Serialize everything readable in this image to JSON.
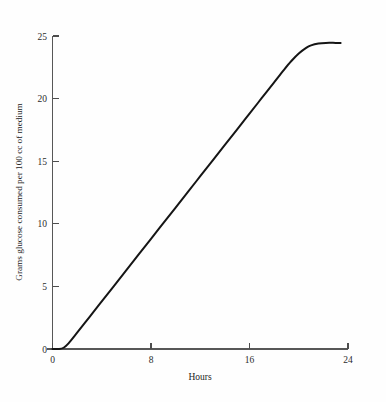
{
  "chart_data": {
    "type": "line",
    "title": "",
    "xlabel": "Hours",
    "ylabel": "Grams glucose consumed per 100 cc of medium",
    "xlim": [
      0,
      24
    ],
    "ylim": [
      0,
      25
    ],
    "xticks": [
      0,
      8,
      16,
      24
    ],
    "xticklabels": [
      "0",
      "8",
      "16",
      "24"
    ],
    "yticks": [
      0,
      5,
      10,
      15,
      20,
      25
    ],
    "yticklabels": [
      "0",
      "5",
      "10",
      "15",
      "20",
      "25"
    ],
    "grid": false,
    "legend": "none",
    "series": [
      {
        "name": "glucose consumed",
        "x": [
          0.0,
          0.5,
          0.9,
          1.3,
          2.0,
          3.0,
          4.0,
          5.0,
          6.0,
          7.0,
          8.0,
          9.0,
          10.0,
          11.0,
          12.0,
          13.0,
          14.0,
          15.0,
          16.0,
          17.0,
          18.0,
          18.8,
          19.4,
          20.0,
          20.6,
          21.0,
          21.6,
          22.2,
          23.0,
          23.4
        ],
        "y": [
          0.0,
          0.0,
          0.1,
          0.45,
          1.3,
          2.55,
          3.8,
          5.05,
          6.3,
          7.55,
          8.8,
          10.05,
          11.3,
          12.55,
          13.8,
          15.05,
          16.3,
          17.55,
          18.8,
          20.05,
          21.3,
          22.3,
          23.0,
          23.6,
          24.05,
          24.25,
          24.4,
          24.45,
          24.45,
          24.45
        ]
      }
    ],
    "annotations": {
      "plateau_value": 24.45,
      "lag_end_hours": 0.9,
      "linear_slope_grams_per_hour": 1.25,
      "plateau_start_hours": 21.6,
      "curve_end_hours": 23.4
    }
  }
}
